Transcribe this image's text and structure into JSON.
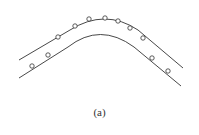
{
  "figure": {
    "caption": "(a)",
    "stroke_color": "#333333",
    "upper_curve": "M19,60 L70,30 Q105,8 138,30 L183,68",
    "lower_curve": "M19,78 L68,47 Q100,22 134,47 L181,86",
    "points": [
      {
        "x": 32,
        "y": 66
      },
      {
        "x": 48,
        "y": 55
      },
      {
        "x": 58,
        "y": 37
      },
      {
        "x": 75,
        "y": 26
      },
      {
        "x": 89,
        "y": 19
      },
      {
        "x": 105,
        "y": 18
      },
      {
        "x": 118,
        "y": 21
      },
      {
        "x": 130,
        "y": 28
      },
      {
        "x": 143,
        "y": 38
      },
      {
        "x": 152,
        "y": 58
      },
      {
        "x": 168,
        "y": 71
      }
    ]
  }
}
